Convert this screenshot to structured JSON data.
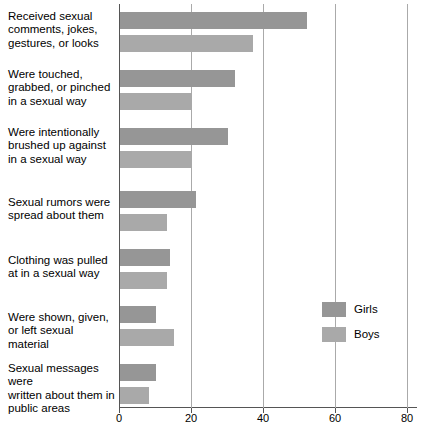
{
  "chart_data": {
    "type": "bar",
    "orientation": "horizontal",
    "title": "",
    "xlabel": "",
    "ylabel": "",
    "xlim": [
      0,
      80
    ],
    "xticks": [
      0,
      20,
      40,
      60,
      80
    ],
    "grid": true,
    "legend_position": "center-right",
    "categories": [
      "Received sexual comments, jokes, gestures, or looks",
      "Were touched, grabbed, or pinched in a sexual way",
      "Were intentionally brushed up against in a sexual way",
      "Sexual rumors were spread about them",
      "Clothing was pulled at in a sexual way",
      "Were shown, given, or left sexual material",
      "Sexual messages were written about them in public areas"
    ],
    "category_lines": [
      [
        "Received sexual",
        "comments, jokes,",
        "gestures, or looks"
      ],
      [
        "Were touched,",
        "grabbed, or pinched",
        "in a sexual way"
      ],
      [
        "Were intentionally",
        "brushed up against",
        "in a sexual way"
      ],
      [
        "Sexual rumors were",
        "spread about them"
      ],
      [
        "Clothing was pulled",
        "at in a sexual way"
      ],
      [
        "Were shown, given,",
        "or left sexual material"
      ],
      [
        "Sexual messages were",
        "written about them in",
        "public areas"
      ]
    ],
    "series": [
      {
        "name": "Girls",
        "color": "#969696",
        "values": [
          52,
          32,
          30,
          21,
          14,
          10,
          10
        ]
      },
      {
        "name": "Boys",
        "color": "#a9a9a9",
        "values": [
          37,
          20,
          20,
          13,
          13,
          15,
          8
        ]
      }
    ]
  },
  "legend": {
    "items": [
      {
        "label": "Girls"
      },
      {
        "label": "Boys"
      }
    ]
  },
  "axis": {
    "tick_labels": [
      "0",
      "20",
      "40",
      "60",
      "80"
    ]
  }
}
